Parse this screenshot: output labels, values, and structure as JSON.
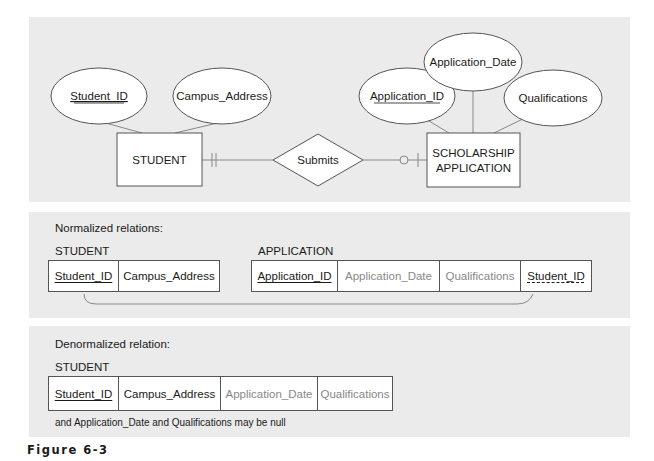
{
  "er_diagram": {
    "entities": [
      {
        "id": "student",
        "label": "STUDENT"
      },
      {
        "id": "scholarship",
        "label_line1": "SCHOLARSHIP",
        "label_line2": "APPLICATION"
      }
    ],
    "relationship": {
      "label": "Submits",
      "student_side": "mandatory-one",
      "application_side": "optional-one"
    },
    "attributes": {
      "student_id": {
        "label": "Student_ID",
        "key": true
      },
      "campus_address": {
        "label": "Campus_Address",
        "key": false
      },
      "application_id": {
        "label": "Application_ID",
        "key": true
      },
      "application_date": {
        "label": "Application_Date",
        "key": false
      },
      "qualifications": {
        "label": "Qualifications",
        "key": false
      }
    }
  },
  "normalized": {
    "caption": "Normalized relations:",
    "student": {
      "name": "STUDENT",
      "columns": [
        {
          "label": "Student_ID",
          "role": "pk"
        },
        {
          "label": "Campus_Address",
          "role": ""
        }
      ]
    },
    "application": {
      "name": "APPLICATION",
      "columns": [
        {
          "label": "Application_ID",
          "role": "pk"
        },
        {
          "label": "Application_Date",
          "role": ""
        },
        {
          "label": "Qualifications",
          "role": ""
        },
        {
          "label": "Student_ID",
          "role": "fk"
        }
      ]
    }
  },
  "denormalized": {
    "caption": "Denormalized relation:",
    "student": {
      "name": "STUDENT",
      "columns": [
        {
          "label": "Student_ID",
          "role": "pk"
        },
        {
          "label": "Campus_Address",
          "role": ""
        },
        {
          "label": "Application_Date",
          "role": ""
        },
        {
          "label": "Qualifications",
          "role": ""
        }
      ]
    },
    "note": "and Application_Date and Qualifications may be null"
  },
  "figure_label": "Figure 6-3"
}
